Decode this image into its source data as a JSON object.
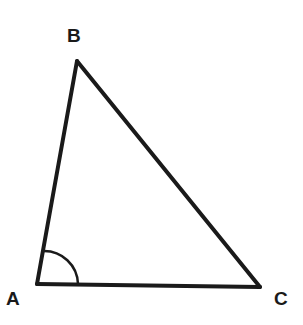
{
  "diagram": {
    "type": "triangle",
    "vertices": [
      {
        "label": "A",
        "x": 37,
        "y": 284
      },
      {
        "label": "B",
        "x": 77,
        "y": 60
      },
      {
        "label": "C",
        "x": 260,
        "y": 287
      }
    ],
    "marked_angle": "A",
    "stroke_color": "#1a1a1a",
    "background": "#ffffff"
  },
  "labels": {
    "a": "A",
    "b": "B",
    "c": "C"
  }
}
